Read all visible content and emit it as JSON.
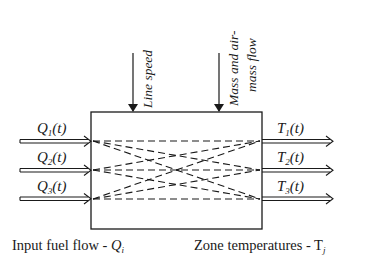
{
  "diagram": {
    "type": "block-diagram",
    "top_inputs": [
      {
        "label": "Line speed",
        "x": 133
      },
      {
        "label_line1": "Mass and air-",
        "label_line2": "mass flow",
        "x": 219
      }
    ],
    "inputs": [
      {
        "symbol": "Q",
        "sub": "1",
        "suffix": "(t)"
      },
      {
        "symbol": "Q",
        "sub": "2",
        "suffix": "(t)"
      },
      {
        "symbol": "Q",
        "sub": "3",
        "suffix": "(t)"
      }
    ],
    "outputs": [
      {
        "symbol": "T",
        "sub": "1",
        "suffix": "(t)"
      },
      {
        "symbol": "T",
        "sub": "2",
        "suffix": "(t)"
      },
      {
        "symbol": "T",
        "sub": "3",
        "suffix": "(t)"
      }
    ],
    "captions": {
      "left_text": "Input fuel flow - ",
      "left_symbol": "Q",
      "left_sub": "i",
      "right_text": "Zone temperatures - T",
      "right_sub": "j"
    },
    "colors": {
      "stroke": "#1a1a1a",
      "background": "#ffffff"
    }
  }
}
